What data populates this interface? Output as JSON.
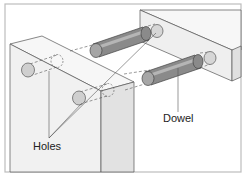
{
  "diagram": {
    "labels": {
      "holes": "Holes",
      "dowel": "Dowel"
    },
    "colors": {
      "frame": "#bdbdbd",
      "block_face": "#f1f1f1",
      "block_side": "#e2e2e2",
      "block_top": "#f7f7f7",
      "edge": "#555555",
      "dowel_body": "#8a8a8a",
      "dowel_highlight": "#b5b5b5",
      "dowel_end": "#a6a6a6",
      "hole": "#cfcfcf",
      "leader": "#555555"
    },
    "parts": [
      {
        "name": "left-block",
        "role": "board with holes"
      },
      {
        "name": "right-block",
        "role": "board with holes"
      },
      {
        "name": "upper-dowel",
        "role": "dowel pin"
      },
      {
        "name": "lower-dowel",
        "role": "dowel pin"
      }
    ]
  }
}
